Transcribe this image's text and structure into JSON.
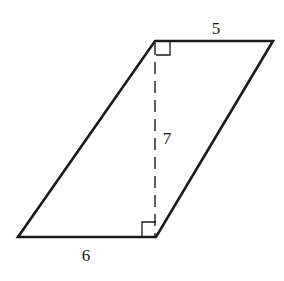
{
  "diagram": {
    "shape": "parallelogram",
    "vertices": {
      "top_left": [
        155,
        41
      ],
      "top_right": [
        273,
        41
      ],
      "bottom_right": [
        156,
        237
      ],
      "bottom_left": [
        18,
        237
      ]
    },
    "labels": {
      "top_side": "5",
      "height": "7",
      "bottom_side": "6"
    },
    "height_line": {
      "style": "dashed",
      "x": 155,
      "y1": 41,
      "y2": 237
    },
    "right_angle_markers": [
      "top",
      "bottom"
    ],
    "colors": {
      "stroke": "#1a1a1a",
      "background": "#ffffff"
    }
  }
}
